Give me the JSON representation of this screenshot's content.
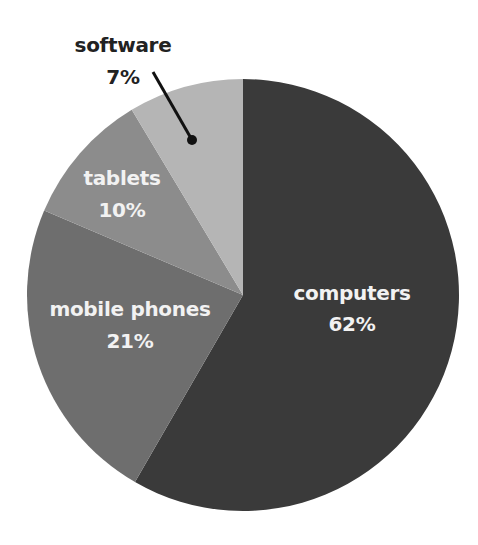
{
  "chart_data": {
    "type": "pie",
    "title": "",
    "categories": [
      "computers",
      "mobile phones",
      "tablets",
      "software"
    ],
    "values": [
      62,
      21,
      10,
      7
    ],
    "unit": "%",
    "start_angle_deg": 0,
    "direction": "clockwise",
    "drawn_angles_deg": [
      [
        0,
        210
      ],
      [
        210,
        293
      ],
      [
        293,
        329
      ],
      [
        329,
        360
      ]
    ],
    "colors": [
      "#3a3a3a",
      "#6e6e6e",
      "#8c8c8c",
      "#b5b5b5"
    ],
    "legend": "none (direct labels)"
  },
  "labels": {
    "computers": {
      "name": "computers",
      "pct": "62%"
    },
    "mobile": {
      "name": "mobile phones",
      "pct": "21%"
    },
    "tablets": {
      "name": "tablets",
      "pct": "10%"
    },
    "software": {
      "name": "software",
      "pct": "7%"
    }
  }
}
